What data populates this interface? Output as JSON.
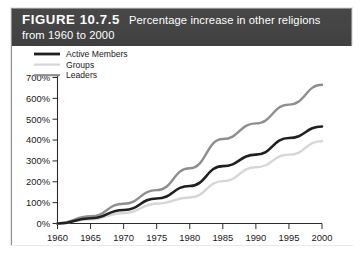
{
  "figure": {
    "label": "FIGURE 10.7.5",
    "caption": "Percentage increase in other religions from 1960 to 2000"
  },
  "legend": {
    "position": "top-left-inside",
    "items": [
      {
        "name": "Active Members",
        "color": "#231f20"
      },
      {
        "name": "Groups",
        "color": "#d6d6d6"
      },
      {
        "name": "Leaders",
        "color": "#8e8e8e"
      }
    ]
  },
  "axes": {
    "y_tick_labels": [
      "700%",
      "600%",
      "500%",
      "400%",
      "300%",
      "200%",
      "100%",
      "0%"
    ],
    "x_tick_labels": [
      "1960",
      "1965",
      "1970",
      "1975",
      "1980",
      "1985",
      "1990",
      "1995",
      "2000"
    ]
  },
  "chart_data": {
    "type": "line",
    "title": "Percentage increase in other religions from 1960 to 2000",
    "xlabel": "",
    "ylabel": "",
    "x": [
      1960,
      1965,
      1970,
      1975,
      1980,
      1985,
      1990,
      1995,
      2000
    ],
    "categories": [
      "1960",
      "1965",
      "1970",
      "1975",
      "1980",
      "1985",
      "1990",
      "1995",
      "2000"
    ],
    "series": [
      {
        "name": "Active Members",
        "color": "#231f20",
        "width": 2.6,
        "values": [
          0,
          25,
          65,
          120,
          180,
          275,
          330,
          410,
          465
        ]
      },
      {
        "name": "Groups",
        "color": "#d6d6d6",
        "width": 2.4,
        "values": [
          0,
          20,
          50,
          95,
          125,
          203,
          270,
          330,
          395
        ]
      },
      {
        "name": "Leaders",
        "color": "#8e8e8e",
        "width": 2.4,
        "values": [
          0,
          35,
          95,
          160,
          265,
          405,
          480,
          570,
          665
        ]
      }
    ],
    "xlim": [
      1960,
      2000
    ],
    "ylim": [
      0,
      700
    ],
    "ytick_values": [
      0,
      100,
      200,
      300,
      400,
      500,
      600,
      700
    ],
    "ytick_suffix": "%",
    "grid": false,
    "legend_position": "upper left"
  },
  "colors": {
    "title_band": "#444444",
    "title_text": "#ffffff",
    "frame_border": "#8d8d8d",
    "axis": "#2b2b2b",
    "plot_background": "#ffffff"
  }
}
